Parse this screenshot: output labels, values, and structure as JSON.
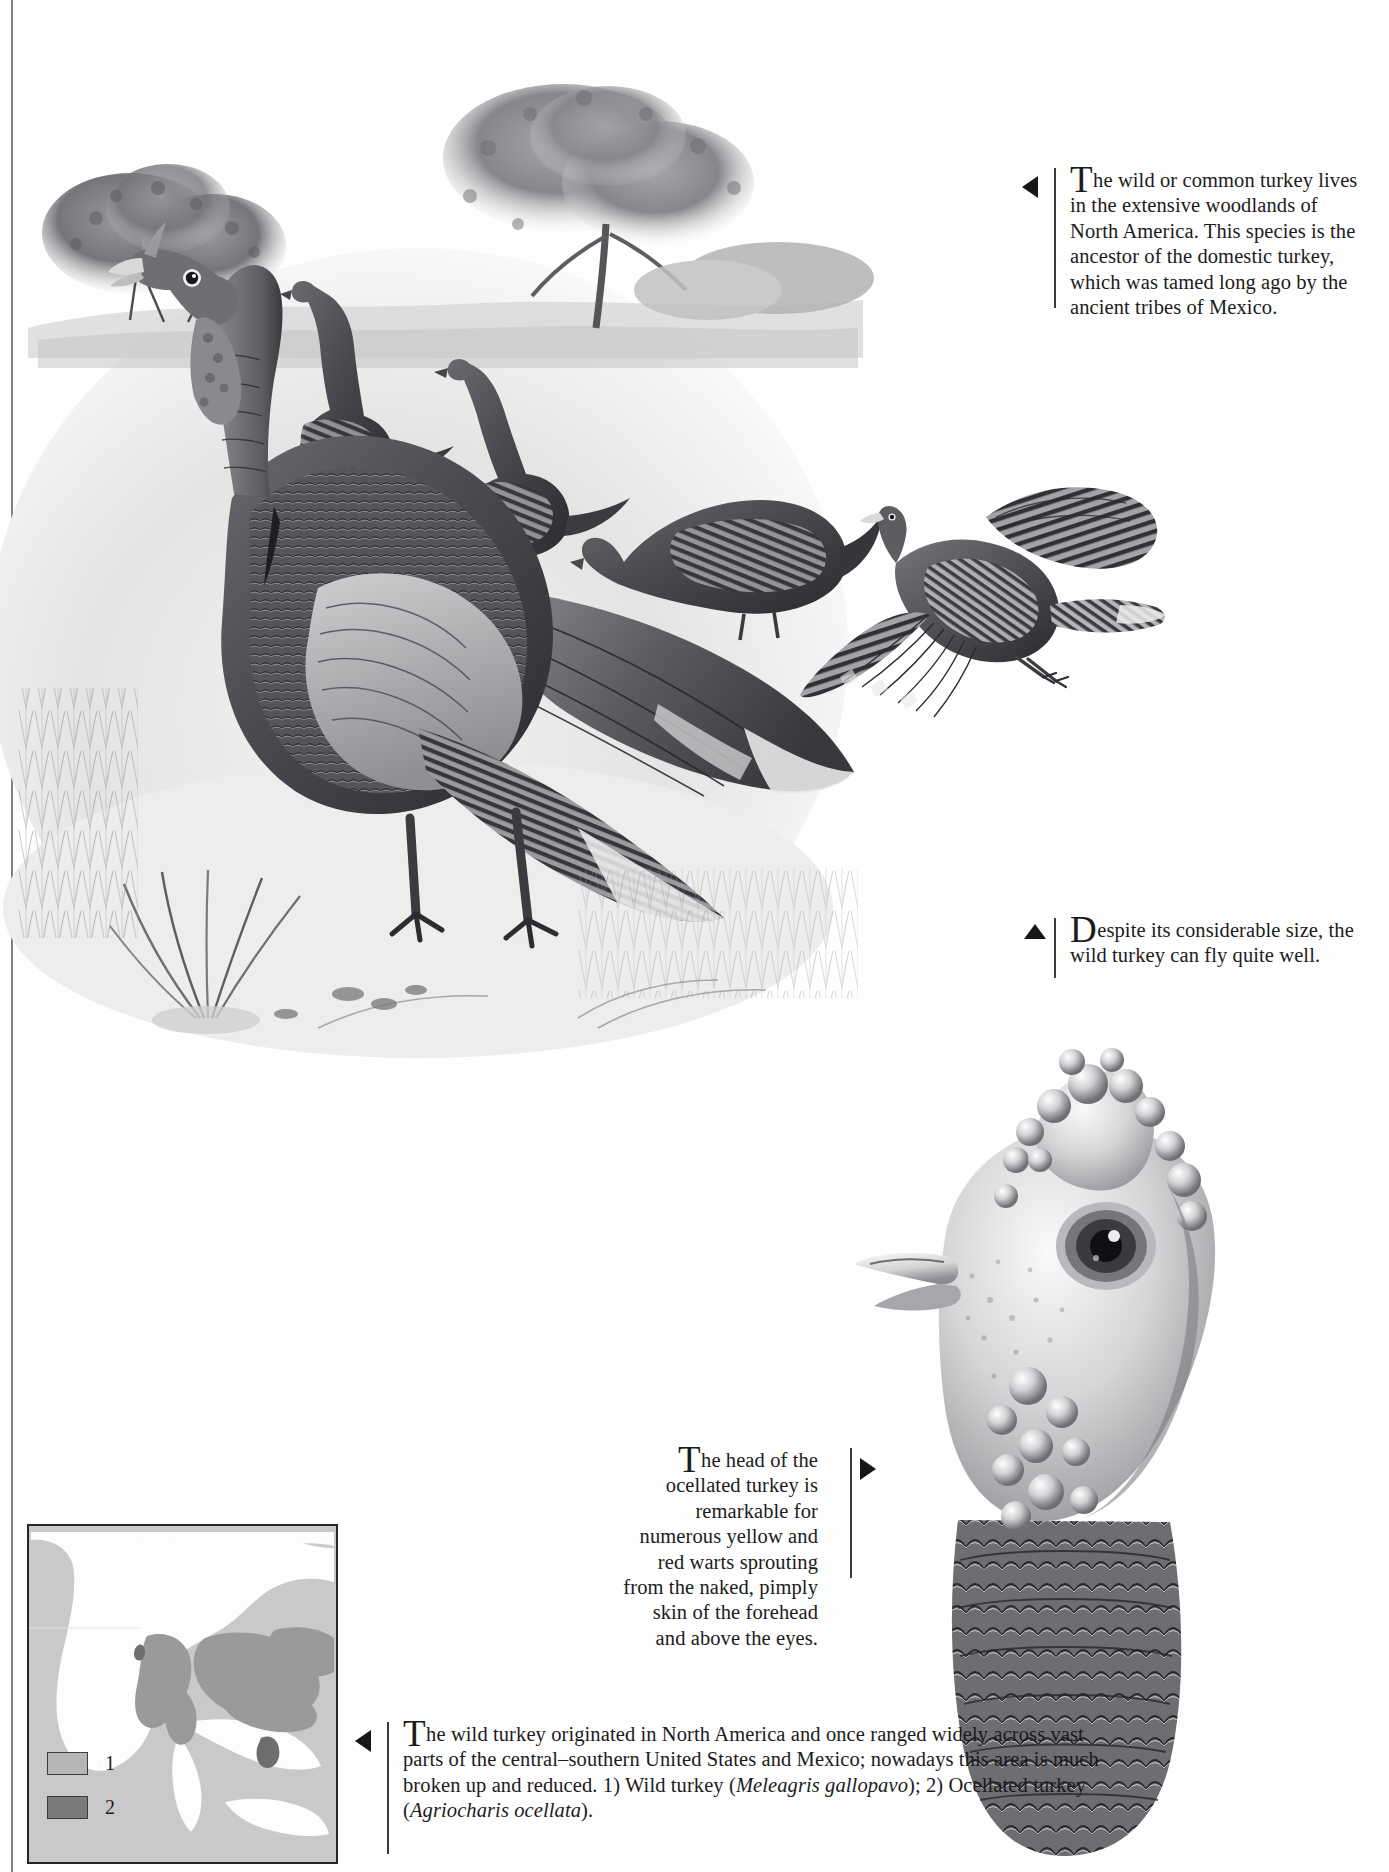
{
  "page": {
    "title": "Wild Turkey",
    "background_color": "#fefefe",
    "ink_color": "#1b1b20"
  },
  "captions": [
    {
      "id": "cap-woodlands",
      "marker": "triangle-left",
      "dropcap": "T",
      "text": "he wild or common turkey lives in the extensive woodlands of North America. This species is the ancestor of the domestic turkey, which was tamed long ago by the ancient tribes of Mexico.",
      "align": "left"
    },
    {
      "id": "cap-flight",
      "marker": "triangle-up",
      "dropcap": "D",
      "text": "espite its considerable size, the wild turkey can fly quite well.",
      "align": "left"
    },
    {
      "id": "cap-ocellated",
      "marker": "triangle-right",
      "dropcap": "T",
      "text": "he head of the ocellated turkey is remarkable for numerous yellow and red warts sprouting from the naked, pimply skin of the forehead and above the eyes.",
      "align": "right"
    },
    {
      "id": "cap-map",
      "marker": "triangle-left",
      "dropcap": "T",
      "text_part1": "he wild turkey originated in North America and once ranged widely across vast parts of the central–southern United States and Mexico; nowadays this area is much broken up and reduced. 1) Wild turkey (",
      "species1": "Meleagris gallopavo",
      "text_part2": "); 2) Ocellated turkey (",
      "species2": "Agriocharis ocellata",
      "text_part3": ").",
      "align": "left"
    }
  ],
  "map": {
    "legend": [
      {
        "key": "1",
        "label": "1",
        "color": "#b6b6b6"
      },
      {
        "key": "2",
        "label": "2",
        "color": "#7b7b7b"
      }
    ],
    "sea_color": "#c9c9c9",
    "land_color": "#fdfdfd",
    "range_color": "#9a9a9a",
    "border_color": "#25252a"
  },
  "illustrations": [
    {
      "id": "art-scene",
      "name": "wild-turkey-flock-landscape"
    },
    {
      "id": "art-flight",
      "name": "wild-turkey-in-flight"
    },
    {
      "id": "art-head",
      "name": "ocellated-turkey-head"
    }
  ]
}
